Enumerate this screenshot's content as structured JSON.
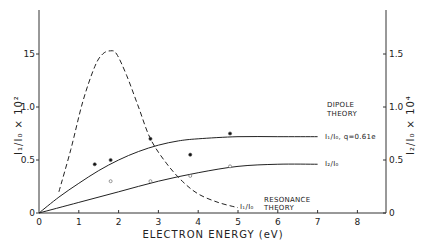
{
  "chart_data": {
    "type": "line",
    "title": "",
    "xlabel": "ELECTRON ENERGY (eV)",
    "ylabel": "I1/I0 x 10^2",
    "ylabel_right": "I2/I0 x 10^4",
    "xlim": [
      0,
      8.7
    ],
    "ylim": [
      0,
      1.9
    ],
    "ylim_right": [
      0,
      1.9
    ],
    "x_ticks": [
      "0",
      "1",
      "2",
      "3",
      "4",
      "5",
      "6",
      "7",
      "8"
    ],
    "y_ticks_left": [
      "0",
      "0.5",
      "1.0",
      "15"
    ],
    "y_ticks_right": [
      "0",
      "0.5",
      "1.0",
      "1.5"
    ],
    "grid": false,
    "series": [
      {
        "name": "I1/I0, q=0.61e (Dipole theory)",
        "style": "solid",
        "x": [
          0,
          0.5,
          1,
          1.5,
          2,
          2.5,
          3,
          3.5,
          4,
          5,
          6,
          7
        ],
        "y": [
          0,
          0.15,
          0.28,
          0.4,
          0.5,
          0.58,
          0.64,
          0.68,
          0.7,
          0.72,
          0.72,
          0.72
        ]
      },
      {
        "name": "I2/I0 (Dipole theory)",
        "style": "solid",
        "x": [
          0,
          1,
          2,
          3,
          4,
          5,
          6,
          7
        ],
        "y": [
          0,
          0.1,
          0.2,
          0.3,
          0.38,
          0.44,
          0.46,
          0.46
        ]
      },
      {
        "name": "I1/I0 Resonance theory",
        "style": "dashed",
        "x": [
          0.5,
          0.8,
          1.1,
          1.4,
          1.6,
          1.8,
          1.95,
          2.2,
          2.5,
          2.8,
          3.2,
          3.6,
          4,
          4.5,
          5
        ],
        "y": [
          0.2,
          0.6,
          1.05,
          1.38,
          1.5,
          1.53,
          1.5,
          1.3,
          1.0,
          0.7,
          0.47,
          0.3,
          0.18,
          0.1,
          0.05
        ]
      },
      {
        "name": "I1/I0 measured",
        "style": "filled-dot",
        "x": [
          1.4,
          1.8,
          2.8,
          3.8,
          4.8
        ],
        "y": [
          0.46,
          0.5,
          0.7,
          0.55,
          0.75
        ]
      },
      {
        "name": "I2/I0 measured",
        "style": "open-dot",
        "x": [
          1.8,
          2.8,
          3.8,
          4.8
        ],
        "y": [
          0.3,
          0.3,
          0.35,
          0.44
        ]
      }
    ],
    "annotations": [
      "DIPOLE THEORY",
      "I1/I0, q=0.61e",
      "I2/I0",
      "I1/I0 RESONANCE THEORY"
    ]
  },
  "labels": {
    "xlabel": "ELECTRON ENERGY (eV)",
    "dipole1": "DIPOLE",
    "dipole2": "THEORY",
    "series1": "I₁/I₀, q=0.61e",
    "series2": "I₂/I₀",
    "res_label": "I₁/I₀",
    "res1": "RESONANCE",
    "res2": "THEORY",
    "ylabel_left": "I₁/I₀ × 10²",
    "ylabel_right": "I₂/I₀ × 10⁴"
  }
}
